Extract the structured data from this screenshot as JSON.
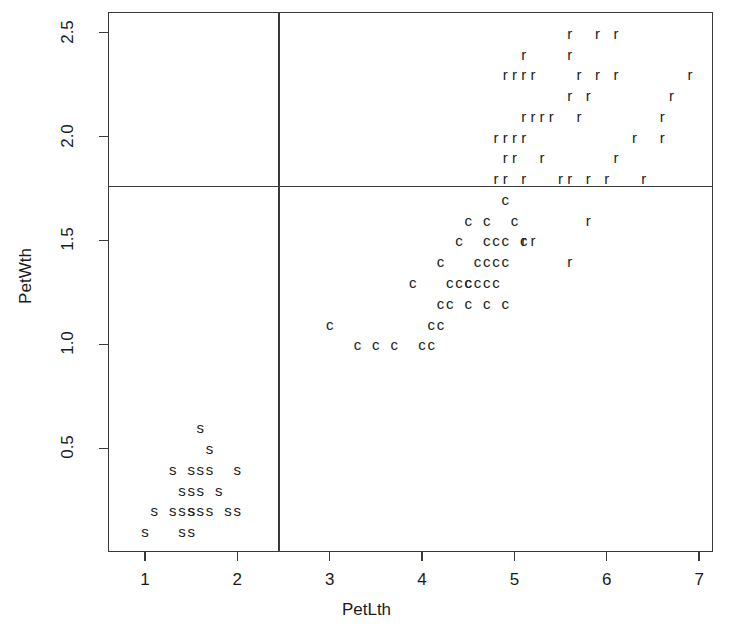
{
  "chart_data": {
    "type": "scatter",
    "title": "",
    "xlabel": "PetLth",
    "ylabel": "PetWth",
    "xlim": [
      0.6,
      7.15
    ],
    "ylim": [
      0.0,
      2.6
    ],
    "xticks": [
      1,
      2,
      3,
      4,
      5,
      6,
      7
    ],
    "xticklabels": [
      "1",
      "2",
      "3",
      "4",
      "5",
      "6",
      "7"
    ],
    "yticks": [
      0.5,
      1.0,
      1.5,
      2.0,
      2.5
    ],
    "yticklabels": [
      "0.5",
      "1.0",
      "1.5",
      "2.0",
      "2.5"
    ],
    "grid": false,
    "legend": "none",
    "marker_style": "text-letter",
    "annotations": [
      {
        "name": "vertical-partition",
        "type": "vline",
        "x": 2.45
      },
      {
        "name": "horizontal-partition",
        "type": "hline",
        "y": 1.76
      }
    ],
    "series": [
      {
        "name": "s",
        "label": "s",
        "color": "#222222",
        "points": [
          [
            1.6,
            0.6
          ],
          [
            1.7,
            0.5
          ],
          [
            1.3,
            0.4
          ],
          [
            1.5,
            0.4
          ],
          [
            1.6,
            0.4
          ],
          [
            1.7,
            0.4
          ],
          [
            2.0,
            0.4
          ],
          [
            1.4,
            0.3
          ],
          [
            1.5,
            0.3
          ],
          [
            1.6,
            0.3
          ],
          [
            1.8,
            0.3
          ],
          [
            1.1,
            0.2
          ],
          [
            1.3,
            0.2
          ],
          [
            1.4,
            0.2
          ],
          [
            1.5,
            0.2
          ],
          [
            1.5,
            0.2
          ],
          [
            1.6,
            0.2
          ],
          [
            1.7,
            0.2
          ],
          [
            1.9,
            0.2
          ],
          [
            2.0,
            0.2
          ],
          [
            1.0,
            0.1
          ],
          [
            1.4,
            0.1
          ],
          [
            1.5,
            0.1
          ]
        ]
      },
      {
        "name": "c",
        "label": "c",
        "color": "#222222",
        "points": [
          [
            4.9,
            1.7
          ],
          [
            4.5,
            1.6
          ],
          [
            4.7,
            1.6
          ],
          [
            5.0,
            1.6
          ],
          [
            4.4,
            1.5
          ],
          [
            4.7,
            1.5
          ],
          [
            4.8,
            1.5
          ],
          [
            4.9,
            1.5
          ],
          [
            5.1,
            1.5
          ],
          [
            4.2,
            1.4
          ],
          [
            4.6,
            1.4
          ],
          [
            4.7,
            1.4
          ],
          [
            4.8,
            1.4
          ],
          [
            4.9,
            1.4
          ],
          [
            3.9,
            1.3
          ],
          [
            4.3,
            1.3
          ],
          [
            4.4,
            1.3
          ],
          [
            4.5,
            1.3
          ],
          [
            4.5,
            1.3
          ],
          [
            4.6,
            1.3
          ],
          [
            4.7,
            1.3
          ],
          [
            4.8,
            1.3
          ],
          [
            4.2,
            1.2
          ],
          [
            4.3,
            1.2
          ],
          [
            4.5,
            1.2
          ],
          [
            4.7,
            1.2
          ],
          [
            4.9,
            1.2
          ],
          [
            3.0,
            1.1
          ],
          [
            4.1,
            1.1
          ],
          [
            4.2,
            1.1
          ],
          [
            3.3,
            1.0
          ],
          [
            3.5,
            1.0
          ],
          [
            3.7,
            1.0
          ],
          [
            4.0,
            1.0
          ],
          [
            4.1,
            1.0
          ]
        ]
      },
      {
        "name": "r",
        "label": "r",
        "color": "#222222",
        "points": [
          [
            5.6,
            2.5
          ],
          [
            5.9,
            2.5
          ],
          [
            6.1,
            2.5
          ],
          [
            5.1,
            2.4
          ],
          [
            5.6,
            2.4
          ],
          [
            4.9,
            2.3
          ],
          [
            5.0,
            2.3
          ],
          [
            5.1,
            2.3
          ],
          [
            5.2,
            2.3
          ],
          [
            5.7,
            2.3
          ],
          [
            5.9,
            2.3
          ],
          [
            6.1,
            2.3
          ],
          [
            6.9,
            2.3
          ],
          [
            5.6,
            2.2
          ],
          [
            5.8,
            2.2
          ],
          [
            6.7,
            2.2
          ],
          [
            5.1,
            2.1
          ],
          [
            5.2,
            2.1
          ],
          [
            5.3,
            2.1
          ],
          [
            5.4,
            2.1
          ],
          [
            5.7,
            2.1
          ],
          [
            6.6,
            2.1
          ],
          [
            4.8,
            2.0
          ],
          [
            4.9,
            2.0
          ],
          [
            5.0,
            2.0
          ],
          [
            5.1,
            2.0
          ],
          [
            6.3,
            2.0
          ],
          [
            6.6,
            2.0
          ],
          [
            4.9,
            1.9
          ],
          [
            5.0,
            1.9
          ],
          [
            5.3,
            1.9
          ],
          [
            6.1,
            1.9
          ],
          [
            4.8,
            1.8
          ],
          [
            4.9,
            1.8
          ],
          [
            5.1,
            1.8
          ],
          [
            5.5,
            1.8
          ],
          [
            5.6,
            1.8
          ],
          [
            5.8,
            1.8
          ],
          [
            6.0,
            1.8
          ],
          [
            6.4,
            1.8
          ],
          [
            5.8,
            1.6
          ],
          [
            5.1,
            1.5
          ],
          [
            5.2,
            1.5
          ],
          [
            5.6,
            1.4
          ]
        ]
      }
    ]
  },
  "axes": {
    "x": {
      "label": "PetLth",
      "ticks": [
        {
          "value": 1,
          "text": "1"
        },
        {
          "value": 2,
          "text": "2"
        },
        {
          "value": 3,
          "text": "3"
        },
        {
          "value": 4,
          "text": "4"
        },
        {
          "value": 5,
          "text": "5"
        },
        {
          "value": 6,
          "text": "6"
        },
        {
          "value": 7,
          "text": "7"
        }
      ]
    },
    "y": {
      "label": "PetWth",
      "ticks": [
        {
          "value": 0.5,
          "text": "0.5"
        },
        {
          "value": 1.0,
          "text": "1.0"
        },
        {
          "value": 1.5,
          "text": "1.5"
        },
        {
          "value": 2.0,
          "text": "2.0"
        },
        {
          "value": 2.5,
          "text": "2.5"
        }
      ]
    }
  },
  "style": {
    "frame_color": "#3a3a3a",
    "point_color": "#222222",
    "background": "#ffffff"
  }
}
